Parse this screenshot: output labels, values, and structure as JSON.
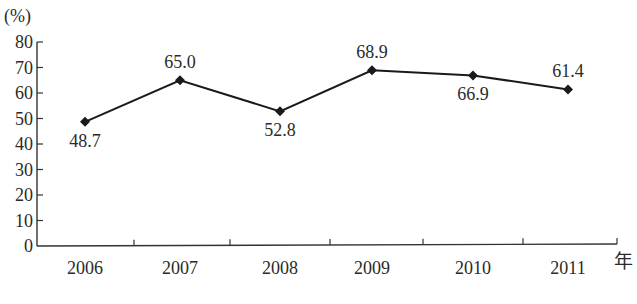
{
  "chart_data": {
    "type": "line",
    "title": "",
    "ylabel": "(%)",
    "xlabel": "年",
    "ylim": [
      0,
      80
    ],
    "yticks": [
      0,
      10,
      20,
      30,
      40,
      50,
      60,
      70,
      80
    ],
    "categories": [
      "2006",
      "2007",
      "2008",
      "2009",
      "2010",
      "2011"
    ],
    "series": [
      {
        "name": "",
        "values": [
          48.7,
          65.0,
          52.8,
          68.9,
          66.9,
          61.4
        ],
        "labels": [
          "48.7",
          "65.0",
          "52.8",
          "68.9",
          "66.9",
          "61.4"
        ],
        "label_position": [
          "below",
          "above",
          "below",
          "above",
          "below",
          "above"
        ],
        "marker": "diamond",
        "color": "#1a1a1a"
      }
    ],
    "grid": false,
    "legend": null
  }
}
